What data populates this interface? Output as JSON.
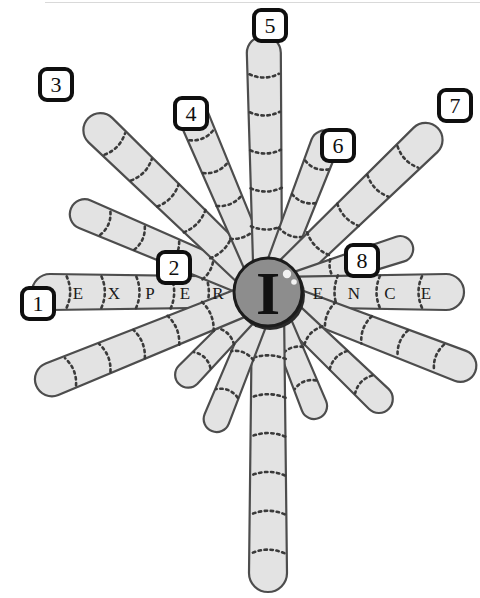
{
  "figure": {
    "center_letter": "I",
    "word": "EXPERIENCE",
    "background_color": "#ffffff",
    "petal_fill": "#e3e3e3",
    "petal_stroke": "#4d4d4d",
    "core_fill": "#8d8d8d",
    "core_stroke": "#1c1c1c",
    "label_box_border": "#0f0f0f"
  },
  "callouts": [
    {
      "id": "1",
      "label": "1",
      "x": 20,
      "y": 286
    },
    {
      "id": "2",
      "label": "2",
      "x": 156,
      "y": 250
    },
    {
      "id": "3",
      "label": "3",
      "x": 38,
      "y": 67
    },
    {
      "id": "4",
      "label": "4",
      "x": 173,
      "y": 96
    },
    {
      "id": "5",
      "label": "5",
      "x": 252,
      "y": 8
    },
    {
      "id": "6",
      "label": "6",
      "x": 320,
      "y": 128
    },
    {
      "id": "7",
      "label": "7",
      "x": 437,
      "y": 88
    },
    {
      "id": "8",
      "label": "8",
      "x": 344,
      "y": 243
    }
  ],
  "petals": [
    {
      "idx": 0,
      "angle": 180,
      "length": 236,
      "width": 36,
      "segments": 6,
      "callout": "1"
    },
    {
      "idx": 1,
      "angle": 157,
      "length": 214,
      "width": 30,
      "segments": 5,
      "callout": "2"
    },
    {
      "idx": 2,
      "angle": 136,
      "length": 250,
      "width": 34,
      "segments": 6,
      "callout": "3"
    },
    {
      "idx": 3,
      "angle": 113,
      "length": 206,
      "width": 30,
      "segments": 5,
      "callout": "4"
    },
    {
      "idx": 4,
      "angle": 91,
      "length": 256,
      "width": 34,
      "segments": 6,
      "callout": "5"
    },
    {
      "idx": 5,
      "angle": 69,
      "length": 172,
      "width": 28,
      "segments": 4,
      "callout": "6"
    },
    {
      "idx": 6,
      "angle": 44,
      "length": 236,
      "width": 34,
      "segments": 5,
      "callout": "7"
    },
    {
      "idx": 7,
      "angle": 18,
      "length": 152,
      "width": 26,
      "segments": 3,
      "callout": "8"
    },
    {
      "idx": 8,
      "angle": 0,
      "length": 196,
      "width": 36,
      "segments": 4,
      "callout": null
    },
    {
      "idx": 9,
      "angle": -21,
      "length": 222,
      "width": 32,
      "segments": 5,
      "callout": null
    },
    {
      "idx": 10,
      "angle": -44,
      "length": 168,
      "width": 28,
      "segments": 4,
      "callout": null
    },
    {
      "idx": 11,
      "angle": -68,
      "length": 136,
      "width": 26,
      "segments": 3,
      "callout": null
    },
    {
      "idx": 12,
      "angle": -90,
      "length": 300,
      "width": 38,
      "segments": 7,
      "callout": null
    },
    {
      "idx": 13,
      "angle": -112,
      "length": 150,
      "width": 26,
      "segments": 3,
      "callout": null
    },
    {
      "idx": 14,
      "angle": -134,
      "length": 128,
      "width": 26,
      "segments": 3,
      "callout": null
    },
    {
      "idx": 15,
      "angle": -158,
      "length": 250,
      "width": 34,
      "segments": 6,
      "callout": null
    }
  ],
  "letters_left": [
    {
      "char": "E",
      "dist": 190
    },
    {
      "char": "X",
      "dist": 154
    },
    {
      "char": "P",
      "dist": 118
    },
    {
      "char": "E",
      "dist": 83
    },
    {
      "char": "R",
      "dist": 50
    }
  ],
  "letters_right": [
    {
      "char": "E",
      "dist": 50
    },
    {
      "char": "N",
      "dist": 86
    },
    {
      "char": "C",
      "dist": 122
    },
    {
      "char": "E",
      "dist": 158
    }
  ],
  "core": {
    "cx": 268,
    "cy": 292,
    "r": 34,
    "highlight_dots": [
      {
        "cx": 287,
        "cy": 274,
        "r": 4.2
      },
      {
        "cx": 294,
        "cy": 282,
        "r": 2.8
      }
    ]
  }
}
